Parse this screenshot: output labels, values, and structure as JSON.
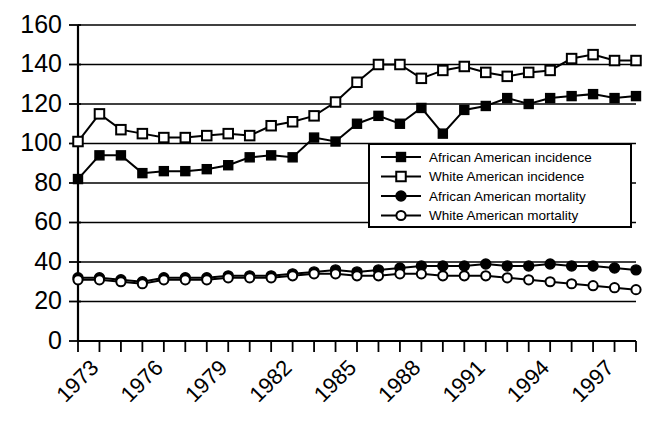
{
  "chart_data": {
    "type": "line",
    "title": "",
    "subtitle": "",
    "xlabel": "",
    "ylabel": "",
    "xlim": [
      1973,
      1999
    ],
    "ylim": [
      0,
      160
    ],
    "grid": true,
    "grid_axis": "y",
    "legend_position": "center-right-inside",
    "x": [
      1973,
      1974,
      1975,
      1976,
      1977,
      1978,
      1979,
      1980,
      1981,
      1982,
      1983,
      1984,
      1985,
      1986,
      1987,
      1988,
      1989,
      1990,
      1991,
      1992,
      1993,
      1994,
      1995,
      1996,
      1997,
      1998,
      1999
    ],
    "xtick_labels": [
      "1973",
      "1976",
      "1979",
      "1982",
      "1985",
      "1988",
      "1991",
      "1994",
      "1997"
    ],
    "xtick_values": [
      1973,
      1976,
      1979,
      1982,
      1985,
      1988,
      1991,
      1994,
      1997
    ],
    "ytick_labels": [
      "0",
      "20",
      "40",
      "60",
      "80",
      "100",
      "120",
      "140",
      "160"
    ],
    "ytick_values": [
      0,
      20,
      40,
      60,
      80,
      100,
      120,
      140,
      160
    ],
    "series": [
      {
        "name": "African American incidence",
        "marker": "filled-square",
        "values": [
          82,
          94,
          94,
          85,
          86,
          86,
          87,
          89,
          93,
          94,
          93,
          103,
          101,
          110,
          114,
          110,
          118,
          105,
          117,
          119,
          123,
          120,
          123,
          124,
          125,
          123,
          124
        ]
      },
      {
        "name": "White American incidence",
        "marker": "open-square",
        "values": [
          101,
          115,
          107,
          105,
          103,
          103,
          104,
          105,
          104,
          109,
          111,
          114,
          121,
          131,
          140,
          140,
          133,
          137,
          139,
          136,
          134,
          136,
          137,
          143,
          145,
          142,
          142
        ]
      },
      {
        "name": "African American mortality",
        "marker": "filled-circle",
        "values": [
          32,
          32,
          31,
          30,
          32,
          32,
          32,
          33,
          33,
          33,
          34,
          35,
          36,
          35,
          36,
          37,
          38,
          38,
          38,
          39,
          38,
          38,
          39,
          38,
          38,
          37,
          36
        ]
      },
      {
        "name": "White American mortality",
        "marker": "open-circle",
        "values": [
          31,
          31,
          30,
          29,
          31,
          31,
          31,
          32,
          32,
          32,
          33,
          34,
          34,
          33,
          33,
          34,
          34,
          33,
          33,
          33,
          32,
          31,
          30,
          29,
          28,
          27,
          26
        ]
      }
    ],
    "colors": {
      "line": "#000000",
      "background": "#ffffff",
      "grid": "#000000"
    }
  },
  "legend": {
    "entries": [
      {
        "label": "African American incidence",
        "marker": "filled-square"
      },
      {
        "label": "White American incidence",
        "marker": "open-square"
      },
      {
        "label": "African American mortality",
        "marker": "filled-circle"
      },
      {
        "label": "White American mortality",
        "marker": "open-circle"
      }
    ]
  }
}
